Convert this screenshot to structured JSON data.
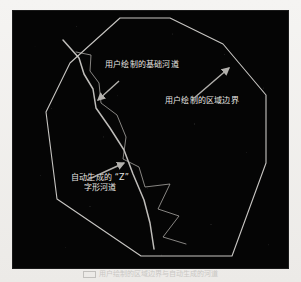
{
  "figure": {
    "panel": {
      "background_color": "#050505",
      "stroke_color": "#d8d6d2",
      "annotation_color": "#e8e6e2"
    },
    "annotations": [
      {
        "id": "base-channel",
        "text": "用户绘制的基础河道",
        "arrow": "points-down-left-to-channel"
      },
      {
        "id": "region-boundary",
        "text": "用户绘制的区域边界",
        "arrow": "points-up-right-to-polygon"
      },
      {
        "id": "auto-z-channel",
        "line1": "自动生成的 “Z”",
        "line2": "字形河道",
        "arrow": "points-up-right-to-zigzag"
      }
    ],
    "caption": {
      "text": "用户绘制的区域边界与自动生成的河道"
    },
    "geometry": {
      "boundary_polygon": "107,7 157,7 210,33 253,84 253,152 219,245 128,245 44,188 33,101 57,52",
      "base_channel": "50,29 66,47 71,63 80,78 83,97 97,117 111,139 120,163 131,189 137,212 141,238",
      "zigzag_channel": "63,41 78,44 77,60 86,72 88,92 104,104 113,126 110,148 126,156 132,176 157,173 145,198 166,205 150,226 173,233"
    }
  }
}
